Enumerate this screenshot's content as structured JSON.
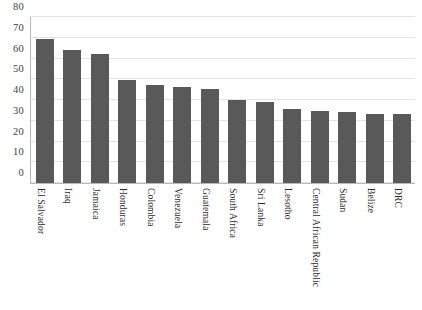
{
  "chart_data": {
    "type": "bar",
    "title": "",
    "xlabel": "",
    "ylabel": "",
    "ylim": [
      0,
      80
    ],
    "yticks": [
      0,
      10,
      20,
      30,
      40,
      50,
      60,
      70,
      80
    ],
    "grid": true,
    "legend": false,
    "bar_color": "#595959",
    "grid_color": "#e3e3e3",
    "categories": [
      "El Salvador",
      "Iraq",
      "Jamaica",
      "Honduras",
      "Colombia",
      "Venezuela",
      "Guatemala",
      "South Africa",
      "Sri Lanka",
      "Lesotho",
      "Central African Republic",
      "Sudan",
      "Belize",
      "DRC"
    ],
    "values": [
      69.5,
      64,
      62,
      49.5,
      47,
      46.5,
      45.5,
      40,
      39,
      35.5,
      34.5,
      34,
      33.5,
      33.5
    ]
  }
}
